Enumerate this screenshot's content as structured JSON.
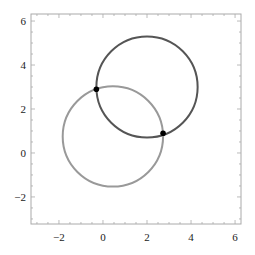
{
  "chart_data": {
    "type": "scatter",
    "title": "",
    "xlabel": "",
    "ylabel": "",
    "xlim": [
      -3.27,
      6.27
    ],
    "ylim": [
      -3.23,
      6.32
    ],
    "grid": false,
    "legend": "none",
    "x_ticks": [
      -2,
      0,
      2,
      4,
      6
    ],
    "y_ticks": [
      -2,
      0,
      2,
      4,
      6
    ],
    "x_tick_labels": [
      "−2",
      "0",
      "2",
      "4",
      "6"
    ],
    "y_tick_labels": [
      "−2",
      "0",
      "2",
      "4",
      "6"
    ],
    "minor_tick_step": 0.5,
    "circles": [
      {
        "name": "dark-circle",
        "center": [
          2.0,
          3.0
        ],
        "radius": 2.3,
        "color": "#555555"
      },
      {
        "name": "light-circle",
        "center": [
          0.45,
          0.75
        ],
        "radius": 2.28,
        "color": "#999999"
      }
    ],
    "points": [
      {
        "name": "intersection-1",
        "x": -0.3,
        "y": 2.9,
        "color": "#000000"
      },
      {
        "name": "intersection-2",
        "x": 2.73,
        "y": 0.9,
        "color": "#000000"
      }
    ],
    "frame_color": "#aaaaaa"
  }
}
